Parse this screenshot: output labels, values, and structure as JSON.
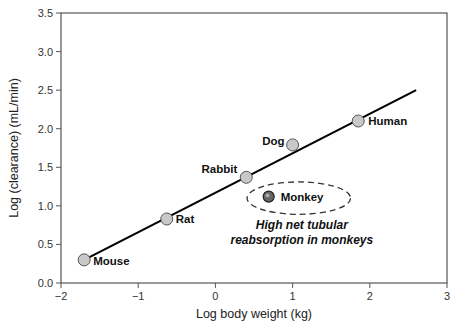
{
  "chart_data": {
    "type": "scatter",
    "title": "",
    "xlabel": "Log body weight (kg)",
    "ylabel": "Log (clearance) (mL/min)",
    "xlim": [
      -2,
      3
    ],
    "ylim": [
      0,
      3.5
    ],
    "x_ticks": [
      -2,
      -1,
      0,
      1,
      2,
      3
    ],
    "x_tick_labels": [
      "−2",
      "−1",
      "0",
      "1",
      "2",
      "3"
    ],
    "y_ticks": [
      0,
      0.5,
      1.0,
      1.5,
      2.0,
      2.5,
      3.0,
      3.5
    ],
    "y_tick_labels": [
      "0.0",
      "0.5",
      "1.0",
      "1.5",
      "2.0",
      "2.5",
      "3.0",
      "3.5"
    ],
    "grid": false,
    "legend": null,
    "series": [
      {
        "name": "Species (allometric fit)",
        "marker_color": "#c8c8c8",
        "points": [
          {
            "label": "Mouse",
            "x": -1.7,
            "y": 0.3
          },
          {
            "label": "Rat",
            "x": -0.63,
            "y": 0.83
          },
          {
            "label": "Rabbit",
            "x": 0.4,
            "y": 1.37
          },
          {
            "label": "Dog",
            "x": 1.0,
            "y": 1.79
          },
          {
            "label": "Human",
            "x": 1.85,
            "y": 2.1
          }
        ]
      },
      {
        "name": "Outlier",
        "marker_color": "#555555",
        "points": [
          {
            "label": "Monkey",
            "x": 0.69,
            "y": 1.12
          }
        ]
      }
    ],
    "fit_line": {
      "x": [
        -1.7,
        2.6
      ],
      "y": [
        0.3,
        2.5
      ],
      "color": "#000000"
    },
    "annotations": [
      {
        "text_lines": [
          "High net tubular",
          "reabsorption in monkeys"
        ],
        "x": 1.12,
        "y": 0.7,
        "style": "bold-italic"
      },
      {
        "shape": "dashed-ellipse",
        "cx": 1.08,
        "cy": 1.1,
        "rx_units": 0.67,
        "ry_units": 0.21
      }
    ]
  }
}
